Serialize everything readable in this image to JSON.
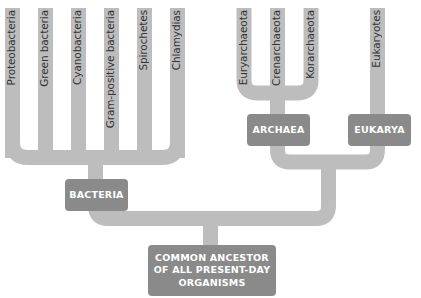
{
  "diagram": {
    "type": "phylogenetic-tree",
    "colors": {
      "branch": "#bdbdbd",
      "node_box": "#8a8a8a",
      "node_text": "#ffffff",
      "leaf_text": "#333333"
    },
    "root": {
      "label": "COMMON ANCESTOR OF ALL PRESENT-DAY ORGANISMS",
      "lines": [
        "COMMON ANCESTOR",
        "OF ALL PRESENT-DAY",
        "ORGANISMS"
      ]
    },
    "domains": [
      {
        "label": "BACTERIA",
        "leaves": [
          "Proteobacteria",
          "Green bacteria",
          "Cyanobacteria",
          "Gram-positive bacteria",
          "Spirochetes",
          "Chlamydias"
        ]
      },
      {
        "label": "ARCHAEA",
        "leaves": [
          "Euryarchaeota",
          "Crenarchaeota",
          "Korarchaeota"
        ]
      },
      {
        "label": "EUKARYA",
        "leaves": [
          "Eukaryotes"
        ]
      }
    ]
  }
}
